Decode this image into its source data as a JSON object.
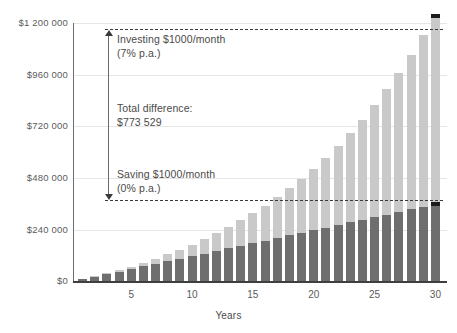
{
  "chart_data": {
    "type": "bar",
    "stacked": true,
    "title": "",
    "subtitle": "",
    "xlabel": "Years",
    "ylabel": "",
    "xlim": [
      0,
      31
    ],
    "ylim": [
      0,
      1200000
    ],
    "grid": true,
    "legend_position": "none",
    "x_tick_labels": [
      "5",
      "10",
      "15",
      "20",
      "25",
      "30"
    ],
    "x_tick_values": [
      5,
      10,
      15,
      20,
      25,
      30
    ],
    "y_tick_labels": [
      "$1 200 000",
      "$960 000",
      "$720 000",
      "$480 000",
      "$240 000",
      "$0"
    ],
    "y_tick_values": [
      1200000,
      960000,
      720000,
      480000,
      240000,
      0
    ],
    "categories": [
      1,
      2,
      3,
      4,
      5,
      6,
      7,
      8,
      9,
      10,
      11,
      12,
      13,
      14,
      15,
      16,
      17,
      18,
      19,
      20,
      21,
      22,
      23,
      24,
      25,
      26,
      27,
      28,
      29,
      30
    ],
    "series": [
      {
        "name": "Saving $1000/month (0% p.a.)",
        "color": "#6e6e6e",
        "values": [
          12000,
          24000,
          36000,
          48000,
          60000,
          72000,
          84000,
          96000,
          108000,
          120000,
          132000,
          144000,
          156000,
          168000,
          180000,
          192000,
          204000,
          216000,
          228000,
          240000,
          252000,
          264000,
          276000,
          288000,
          300000,
          312000,
          324000,
          336000,
          348000,
          360000
        ]
      },
      {
        "name": "Investing $1000/month (7% p.a.)",
        "color": "#c9c9c9",
        "stack_label": "investment growth above savings",
        "totals": [
          12389,
          25676,
          39930,
          55220,
          71625,
          89225,
          108111,
          128376,
          150123,
          173462,
          198512,
          225398,
          254257,
          285234,
          318485,
          354178,
          392494,
          433625,
          477779,
          525179,
          576064,
          630692,
          689338,
          752298,
          819889,
          892452,
          970353,
          1053987,
          1143777,
          1240176
        ],
        "values": [
          13529,
          27563,
          42127,
          57242,
          72931,
          89218,
          106128,
          123687,
          141923,
          160863,
          180538,
          200978,
          222216,
          244284,
          267218,
          291054,
          315830,
          341586,
          368363,
          396205,
          425158,
          455270,
          486591,
          519174,
          553075,
          588350,
          625060,
          663269,
          703042,
          744449
        ]
      }
    ],
    "final_values": {
      "saving_total": 360000,
      "investing_total": 1133529,
      "difference": 773529
    }
  },
  "annotations": {
    "investing": {
      "line1": "Investing $1000/month",
      "line2": "(7% p.a.)"
    },
    "difference": {
      "line1": "Total difference:",
      "line2": "$773 529"
    },
    "saving": {
      "line1": "Saving $1000/month",
      "line2": "(0% p.a.)"
    }
  },
  "axis": {
    "x_title": "Years"
  },
  "colors": {
    "saving_bar": "#6e6e6e",
    "investing_bar": "#c9c9c9",
    "marker_cap": "#1c1c1c",
    "gridline": "#e6e6e6",
    "axis": "#3f3f3f",
    "text": "#4a4a4a",
    "dashed": "#3a3a3a"
  }
}
